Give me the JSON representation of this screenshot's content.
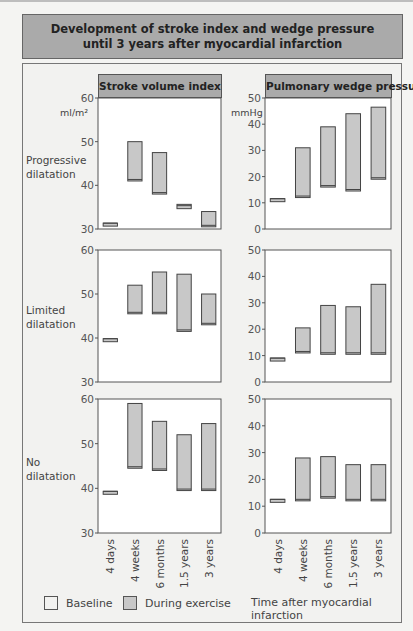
{
  "header": {
    "title_line1": "Development of stroke index and wedge pressure",
    "title_line2": "until 3 years after myocardial infarction"
  },
  "panels": {
    "left_title": "Stroke volume index",
    "right_title": "Pulmonary wedge pressure",
    "left_unit": "ml/m²",
    "right_unit": "mmHg"
  },
  "rows": [
    {
      "label_line1": "Progressive",
      "label_line2": "dilatation"
    },
    {
      "label_line1": "Limited",
      "label_line2": "dilatation"
    },
    {
      "label_line1": "No",
      "label_line2": "dilatation"
    }
  ],
  "x_labels": [
    "4 days",
    "4 weeks",
    "6 months",
    "1.5 years",
    "3 years"
  ],
  "legend": {
    "baseline": "Baseline",
    "exercise": "During exercise",
    "x_title": "Time after myocardial infarction"
  },
  "colors": {
    "bar_fill": "#c8c8c8",
    "bar_edge": "#444444",
    "title_band": "#aaaaaa",
    "plot_bg": "#ffffff",
    "page_bg": "#f3f3f1"
  },
  "chart_data": [
    {
      "type": "bar",
      "subtype": "floating-range",
      "title": "Stroke volume index",
      "row": "Progressive dilatation",
      "ylabel": "ml/m²",
      "ylim": [
        30,
        60
      ],
      "yticks": [
        30,
        40,
        50,
        60
      ],
      "categories": [
        "4 days",
        "4 weeks",
        "6 months",
        "1.5 years",
        "3 years"
      ],
      "series": [
        {
          "name": "Baseline",
          "values": [
            31,
            41,
            38,
            35,
            30.5
          ]
        },
        {
          "name": "During exercise",
          "values": [
            31,
            50,
            47.5,
            35.3,
            34
          ]
        }
      ]
    },
    {
      "type": "bar",
      "subtype": "floating-range",
      "title": "Pulmonary wedge pressure",
      "row": "Progressive dilatation",
      "ylabel": "mmHg",
      "ylim": [
        0,
        50
      ],
      "yticks": [
        0,
        10,
        20,
        30,
        40,
        50
      ],
      "categories": [
        "4 days",
        "4 weeks",
        "6 months",
        "1.5 years",
        "3 years"
      ],
      "series": [
        {
          "name": "Baseline",
          "values": [
            11,
            12,
            16,
            14.5,
            19
          ]
        },
        {
          "name": "During exercise",
          "values": [
            11,
            31,
            39,
            44,
            46.5
          ]
        }
      ]
    },
    {
      "type": "bar",
      "subtype": "floating-range",
      "title": "Stroke volume index",
      "row": "Limited dilatation",
      "ylabel": "ml/m²",
      "ylim": [
        30,
        60
      ],
      "yticks": [
        30,
        40,
        50,
        60
      ],
      "categories": [
        "4 days",
        "4 weeks",
        "6 months",
        "1.5 years",
        "3 years"
      ],
      "series": [
        {
          "name": "Baseline",
          "values": [
            39.5,
            45.5,
            45.5,
            41.5,
            43
          ]
        },
        {
          "name": "During exercise",
          "values": [
            39.5,
            52,
            55,
            54.5,
            50
          ]
        }
      ]
    },
    {
      "type": "bar",
      "subtype": "floating-range",
      "title": "Pulmonary wedge pressure",
      "row": "Limited dilatation",
      "ylabel": "mmHg",
      "ylim": [
        0,
        50
      ],
      "yticks": [
        0,
        10,
        20,
        30,
        40,
        50
      ],
      "categories": [
        "4 days",
        "4 weeks",
        "6 months",
        "1.5 years",
        "3 years"
      ],
      "series": [
        {
          "name": "Baseline",
          "values": [
            8.5,
            11,
            10.5,
            10.5,
            10.5
          ]
        },
        {
          "name": "During exercise",
          "values": [
            8.5,
            20.5,
            29,
            28.5,
            37
          ]
        }
      ]
    },
    {
      "type": "bar",
      "subtype": "floating-range",
      "title": "Stroke volume index",
      "row": "No dilatation",
      "ylabel": "ml/m²",
      "ylim": [
        30,
        60
      ],
      "yticks": [
        30,
        40,
        50,
        60
      ],
      "categories": [
        "4 days",
        "4 weeks",
        "6 months",
        "1.5 years",
        "3 years"
      ],
      "series": [
        {
          "name": "Baseline",
          "values": [
            39,
            44.5,
            44,
            39.5,
            39.5
          ]
        },
        {
          "name": "During exercise",
          "values": [
            39,
            59,
            55,
            52,
            54.5
          ]
        }
      ]
    },
    {
      "type": "bar",
      "subtype": "floating-range",
      "title": "Pulmonary wedge pressure",
      "row": "No dilatation",
      "ylabel": "mmHg",
      "ylim": [
        0,
        50
      ],
      "yticks": [
        0,
        10,
        20,
        30,
        40,
        50
      ],
      "categories": [
        "4 days",
        "4 weeks",
        "6 months",
        "1.5 years",
        "3 years"
      ],
      "series": [
        {
          "name": "Baseline",
          "values": [
            12,
            12,
            13,
            12,
            12
          ]
        },
        {
          "name": "During exercise",
          "values": [
            12,
            28,
            28.5,
            25.5,
            25.5
          ]
        }
      ]
    }
  ]
}
